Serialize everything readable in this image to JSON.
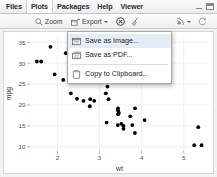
{
  "window": {
    "tabs": [
      {
        "label": "Files",
        "active": false
      },
      {
        "label": "Plots",
        "active": true
      },
      {
        "label": "Packages",
        "active": false
      },
      {
        "label": "Help",
        "active": false
      },
      {
        "label": "Viewer",
        "active": false
      }
    ],
    "minimize_icon": "minimize-icon",
    "maximize_icon": "maximize-icon"
  },
  "toolbar": {
    "zoom_label": "Zoom",
    "zoom_icon": "magnifier-icon",
    "export_label": "Export",
    "export_icon": "export-icon",
    "export_caret": "chevron-down-icon",
    "clear_plot_icon": "clear-plot-icon",
    "clear_all_icon": "broom-icon",
    "publish_icon": "publish-icon",
    "publish_caret": "chevron-down-icon",
    "refresh_icon": "refresh-icon"
  },
  "export_menu": {
    "items": [
      {
        "label": "Save as Image...",
        "icon": "image-icon",
        "highlighted": true
      },
      {
        "label": "Save as PDF...",
        "icon": "pdf-icon",
        "highlighted": false
      },
      {
        "label": "Copy to Clipboard...",
        "icon": "clipboard-icon",
        "highlighted": false
      }
    ]
  },
  "colors": {
    "point": "#000000",
    "panel": "#ffffff",
    "grid": "#f0f0f0",
    "axis_text": "#4d4d4d",
    "menu_highlight": "#e4edf6"
  },
  "chart_data": {
    "type": "scatter",
    "title": "",
    "xlabel": "wt",
    "ylabel": "mpg",
    "xlim": [
      1.35,
      5.6
    ],
    "ylim": [
      9.0,
      36.5
    ],
    "xticks": [
      2,
      3,
      4,
      5
    ],
    "yticks": [
      10,
      15,
      20,
      25,
      30,
      35
    ],
    "grid": true,
    "legend": null,
    "x": [
      2.62,
      2.875,
      2.32,
      3.215,
      3.44,
      3.46,
      3.57,
      3.19,
      3.15,
      3.44,
      3.44,
      4.07,
      3.73,
      3.78,
      5.25,
      5.424,
      5.345,
      2.2,
      1.615,
      1.835,
      2.465,
      3.52,
      3.435,
      3.84,
      3.845,
      1.935,
      2.14,
      1.513,
      3.17,
      2.77,
      3.57,
      2.78
    ],
    "y": [
      21.0,
      21.0,
      22.8,
      21.4,
      18.7,
      18.1,
      14.3,
      24.4,
      22.8,
      19.2,
      17.8,
      16.4,
      17.3,
      15.2,
      10.4,
      10.4,
      14.7,
      32.4,
      30.4,
      33.9,
      21.5,
      15.5,
      15.2,
      13.3,
      19.2,
      27.3,
      26.0,
      30.4,
      15.8,
      19.7,
      15.0,
      21.4
    ]
  }
}
